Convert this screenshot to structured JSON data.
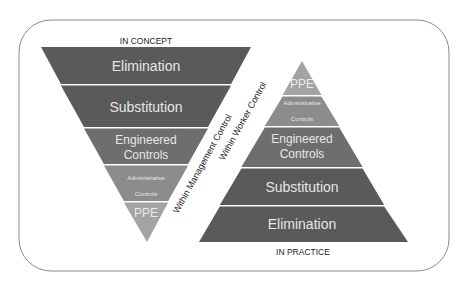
{
  "diagram": {
    "title_top": "IN CONCEPT",
    "title_bottom": "IN PRACTICE",
    "label_management": "Within Management Control",
    "label_worker": "Within Worker Control",
    "colors": {
      "frame": "#8a8a8a",
      "dark": "#5a5a5a",
      "engineered": "#6e6e6e",
      "admin": "#8c8c8c",
      "ppe": "#a3a3a3",
      "divider": "#f0f0f0",
      "text_light": "#e6e6e6",
      "text_dark": "#222222"
    },
    "inverted_triangle": {
      "bands": [
        {
          "label": "Elimination"
        },
        {
          "label": "Substitution"
        },
        {
          "label_line1": "Engineered",
          "label_line2": "Controls"
        },
        {
          "label_line1": "Administrative",
          "label_line2": "Controls"
        },
        {
          "label": "PPE"
        }
      ]
    },
    "pyramid": {
      "bands": [
        {
          "label": "PPE"
        },
        {
          "label_line1": "Administrative",
          "label_line2": "Controls"
        },
        {
          "label_line1": "Engineered",
          "label_line2": "Controls"
        },
        {
          "label": "Substitution"
        },
        {
          "label": "Elimination"
        }
      ]
    }
  }
}
